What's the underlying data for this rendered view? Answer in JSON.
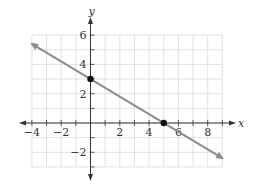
{
  "chart_data": {
    "type": "line",
    "title": "",
    "xlabel": "x",
    "ylabel": "y",
    "xlim": [
      -4,
      9
    ],
    "ylim": [
      -3,
      6
    ],
    "grid": true,
    "x_ticks": [
      -4,
      -2,
      2,
      4,
      6,
      8
    ],
    "y_ticks": [
      -2,
      2,
      4,
      6
    ],
    "x_tick_labels": [
      "−4",
      "−2",
      "2",
      "4",
      "6",
      "8"
    ],
    "y_tick_labels": [
      "−2",
      "2",
      "4",
      "6"
    ],
    "series": [
      {
        "name": "line",
        "equation": "y = -3/5 x + 3",
        "x": [
          -4,
          9
        ],
        "y": [
          5.4,
          -2.4
        ],
        "color": "#888888",
        "arrows": "both"
      }
    ],
    "points": [
      {
        "label": "y-intercept",
        "x": 0,
        "y": 3
      },
      {
        "label": "x-intercept",
        "x": 5,
        "y": 0
      }
    ]
  },
  "colors": {
    "axis": "#333333",
    "grid": "#d9d9d9",
    "line": "#8c8c8c",
    "point": "#111111"
  }
}
